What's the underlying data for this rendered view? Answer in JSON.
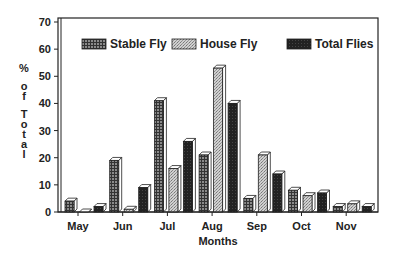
{
  "chart_data": {
    "type": "bar",
    "title": "",
    "xlabel": "Months",
    "ylabel": "% of Total",
    "ylim": [
      0,
      70
    ],
    "yticks": [
      0,
      10,
      20,
      30,
      40,
      50,
      60,
      70
    ],
    "grid": false,
    "legend_position": "top-inside",
    "categories": [
      "May",
      "Jun",
      "Jul",
      "Aug",
      "Sep",
      "Oct",
      "Nov"
    ],
    "series": [
      {
        "name": "Stable Fly",
        "pattern": "grid-dark",
        "color": "#555555",
        "values": [
          4,
          19,
          41,
          21,
          5,
          8,
          2
        ]
      },
      {
        "name": "House Fly",
        "pattern": "stipple-light",
        "color": "#bbbbbb",
        "values": [
          0,
          1,
          16,
          53,
          21,
          6,
          3
        ]
      },
      {
        "name": "Total Flies",
        "pattern": "solid-dark",
        "color": "#222222",
        "values": [
          2,
          9,
          26,
          40,
          14,
          7,
          2
        ]
      }
    ]
  }
}
